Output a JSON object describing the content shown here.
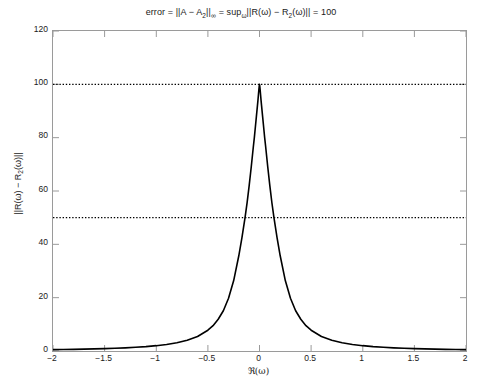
{
  "figure": {
    "background_color": "#ffffff",
    "axis_color": "#9a9a9a",
    "curve_color": "#000000",
    "reference_line_color": "#000000"
  },
  "title": {
    "full_text": "error = ||A − A₂||∞ = sup_ω ||R(ω) − R₂(ω)|| = 100",
    "part_1": "error = ||A − A",
    "part_1_sub": "2",
    "part_2": "||",
    "part_2_sub": "∞",
    "part_3": " = sup",
    "part_3_sub": "ω",
    "part_4": "||R(ω) − R",
    "part_4_sub": "2",
    "part_5": "(ω)|| = 100"
  },
  "axes": {
    "xlabel_prefix": "ℜ(ω)",
    "ylabel_part_1": "||R(ω) − R",
    "ylabel_sub": "2",
    "ylabel_part_2": "(ω)||",
    "x_ticks": [
      "−2",
      "−1.5",
      "−1",
      "−0.5",
      "0",
      "0.5",
      "1",
      "1.5",
      "2"
    ],
    "y_ticks": [
      "0",
      "20",
      "40",
      "60",
      "80",
      "100",
      "120"
    ]
  },
  "chart_data": {
    "type": "line",
    "xlabel": "ℜ(ω)",
    "ylabel": "||R(ω) − R₂(ω)||",
    "xlim": [
      -2,
      2
    ],
    "ylim": [
      0,
      120
    ],
    "xticks": [
      -2,
      -1.5,
      -1,
      -0.5,
      0,
      0.5,
      1,
      1.5,
      2
    ],
    "yticks": [
      0,
      20,
      40,
      60,
      80,
      100,
      120
    ],
    "grid": false,
    "legend": null,
    "series": [
      {
        "name": "||R(ω) − R₂(ω)||",
        "style": "solid",
        "color": "#000000",
        "linewidth": 1.6,
        "description": "Sharp resonance peak centred at ω = 0, peak value 100, rapid Lorentzian-like decay to near 0 for |ω| > 1",
        "x": [
          -2.0,
          -1.9,
          -1.8,
          -1.7,
          -1.6,
          -1.5,
          -1.4,
          -1.3,
          -1.2,
          -1.1,
          -1.0,
          -0.9,
          -0.8,
          -0.7,
          -0.6,
          -0.5,
          -0.45,
          -0.4,
          -0.35,
          -0.3,
          -0.25,
          -0.2,
          -0.17,
          -0.14,
          -0.12,
          -0.1,
          -0.08,
          -0.06,
          -0.05,
          -0.04,
          -0.03,
          -0.02,
          -0.015,
          -0.01,
          -0.006,
          -0.003,
          -0.001,
          0.0,
          0.001,
          0.003,
          0.006,
          0.01,
          0.015,
          0.02,
          0.03,
          0.04,
          0.05,
          0.06,
          0.08,
          0.1,
          0.12,
          0.14,
          0.17,
          0.2,
          0.25,
          0.3,
          0.35,
          0.4,
          0.45,
          0.5,
          0.6,
          0.7,
          0.8,
          0.9,
          1.0,
          1.1,
          1.2,
          1.3,
          1.4,
          1.5,
          1.6,
          1.7,
          1.8,
          1.9,
          2.0
        ],
        "y": [
          0.5,
          0.55,
          0.62,
          0.69,
          0.78,
          0.89,
          1.02,
          1.18,
          1.39,
          1.65,
          2.0,
          2.46,
          3.1,
          4.03,
          5.45,
          7.8,
          9.5,
          11.9,
          15.1,
          19.8,
          26.4,
          35.8,
          42.5,
          50.0,
          55.6,
          62.0,
          69.0,
          76.5,
          80.0,
          84.0,
          88.0,
          92.0,
          94.0,
          96.3,
          98.0,
          99.2,
          99.8,
          100.0,
          99.8,
          99.2,
          98.0,
          96.3,
          94.0,
          92.0,
          88.0,
          84.0,
          80.0,
          76.5,
          69.0,
          62.0,
          55.6,
          50.0,
          42.5,
          35.8,
          26.4,
          19.8,
          15.1,
          11.9,
          9.5,
          7.8,
          5.45,
          4.03,
          3.1,
          2.46,
          2.0,
          1.65,
          1.39,
          1.18,
          1.02,
          0.89,
          0.78,
          0.69,
          0.62,
          0.55,
          0.5
        ]
      }
    ],
    "reference_lines": [
      {
        "name": "upper-bound-line",
        "orientation": "horizontal",
        "value": 100,
        "style": "dotted",
        "color": "#000000"
      },
      {
        "name": "half-bound-line",
        "orientation": "horizontal",
        "value": 50,
        "style": "dotted",
        "color": "#000000"
      }
    ],
    "annotations": []
  }
}
